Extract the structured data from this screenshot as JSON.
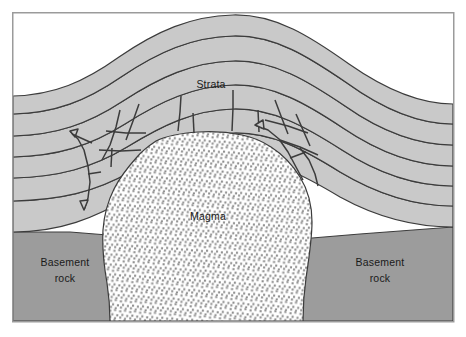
{
  "figure": {
    "title_visible": false,
    "type": "geological-cross-section",
    "background_color": "#ffffff",
    "frame": {
      "name": "figure-border",
      "stroke_color": "#9b9b9b",
      "stroke_width": 1.5,
      "x": 12,
      "y": 12,
      "width": 442,
      "height": 310
    }
  },
  "palette": {
    "strata_fill": "#c9c9c9",
    "basement_fill": "#9c9c9c",
    "magma_fill": "#ffffff",
    "magma_dot": "#8e8e8e",
    "outline": "#3c3c3c",
    "label_text": "#1a1a1a",
    "page_background": "#ffffff"
  },
  "labels": {
    "strata": {
      "text": "Strata",
      "x": 211,
      "y": 88
    },
    "magma": {
      "text": "Magma",
      "x": 208,
      "y": 220
    },
    "basement_rock_left": {
      "line1": "Basement",
      "line2": "rock",
      "x": 65,
      "y_line1": 266,
      "y_line2": 282
    },
    "basement_rock_right": {
      "line1": "Basement",
      "line2": "rock",
      "x": 380,
      "y_line1": 266,
      "y_line2": 282
    }
  },
  "geology": {
    "units": [
      {
        "name": "basement-rock",
        "label": "Basement rock",
        "fill": "#9c9c9c",
        "description": "undeformed crystalline basement beneath the sedimentary cover"
      },
      {
        "name": "strata",
        "label": "Strata",
        "fill": "#c9c9c9",
        "layer_count": 6,
        "description": "layered sedimentary beds arched upward into a dome"
      },
      {
        "name": "magma-body",
        "label": "Magma",
        "fill": "#ffffff",
        "stipple": true,
        "description": "stippled intrusive magma body forming a mushroom-shaped laccolith"
      },
      {
        "name": "fracture-zone",
        "label": "",
        "description": "brecciated and faulted roof blocks above the intrusion"
      }
    ]
  }
}
